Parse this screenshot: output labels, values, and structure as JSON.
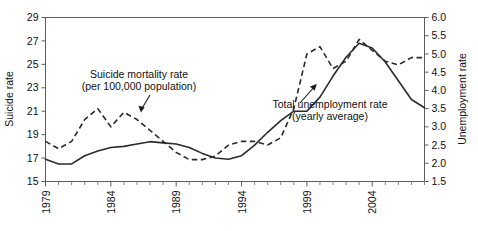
{
  "chart_data": {
    "type": "line",
    "title": "",
    "subtitle": "",
    "xlabel": "",
    "ylabel": "Suicide rate",
    "y2label": "Unemployment rate",
    "xlim": [
      1979,
      2008
    ],
    "ylim": [
      15,
      29
    ],
    "y2lim": [
      1.5,
      6.0
    ],
    "grid": false,
    "legend_position": "inline-annotations",
    "x": [
      1979,
      1980,
      1981,
      1982,
      1983,
      1984,
      1985,
      1986,
      1987,
      1988,
      1989,
      1990,
      1991,
      1992,
      1993,
      1994,
      1995,
      1996,
      1997,
      1998,
      1999,
      2000,
      2001,
      2002,
      2003,
      2004,
      2005,
      2006,
      2007,
      2008
    ],
    "xticks": [
      1979,
      1984,
      1989,
      1994,
      1999,
      2004
    ],
    "xticklabels": [
      "1979",
      "1984",
      "1989",
      "1994",
      "1999",
      "2004"
    ],
    "yticks": [
      15,
      17,
      19,
      21,
      23,
      25,
      27,
      29
    ],
    "yticklabels": [
      "15",
      "17",
      "19",
      "21",
      "23",
      "25",
      "27",
      "29"
    ],
    "y2ticks": [
      1.5,
      2.0,
      2.5,
      3.0,
      3.5,
      4.0,
      4.5,
      5.0,
      5.5,
      6.0
    ],
    "y2ticklabels": [
      "1.5",
      "2.0",
      "2.5",
      "3.0",
      "3.5",
      "4.0",
      "4.5",
      "5.0",
      "5.5",
      "6.0"
    ],
    "series": [
      {
        "name": "Suicide mortality rate (per 100,000 population)",
        "axis": "left",
        "style": "solid",
        "color": "#2b2b2b",
        "values": [
          16.9,
          16.5,
          16.5,
          17.2,
          17.6,
          17.9,
          18.0,
          18.2,
          18.4,
          18.3,
          18.2,
          17.9,
          17.4,
          17.0,
          16.9,
          17.2,
          18.1,
          19.2,
          20.2,
          21.0,
          21.0,
          22.2,
          24.0,
          25.6,
          26.8,
          26.4,
          25.2,
          23.6,
          22.0,
          21.3
        ]
      },
      {
        "name": "Total unemployment rate (yearly average)",
        "axis": "right",
        "style": "dashed",
        "color": "#2b2b2b",
        "values": [
          2.6,
          2.4,
          2.6,
          3.2,
          3.5,
          3.0,
          3.4,
          3.2,
          2.9,
          2.6,
          2.3,
          2.1,
          2.1,
          2.2,
          2.5,
          2.6,
          2.6,
          2.5,
          2.7,
          3.5,
          5.0,
          5.2,
          4.6,
          4.8,
          5.4,
          5.1,
          4.8,
          4.7,
          4.9,
          4.9
        ]
      }
    ],
    "annotations": [
      {
        "id": "suicide-annotation",
        "line1": "Suicide mortality rate",
        "line2": "(per 100,000 population)",
        "points_to_series": "Suicide mortality rate (per 100,000 population)"
      },
      {
        "id": "unemployment-annotation",
        "line1": "Total unemployment rate",
        "line2": "(yearly average)",
        "points_to_series": "Total unemployment rate (yearly average)"
      }
    ]
  }
}
